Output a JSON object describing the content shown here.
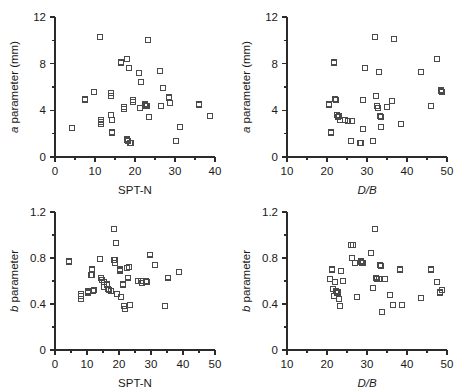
{
  "figure": {
    "background": "#ffffff",
    "marker_color": "#4a4a4a",
    "axis_color": "#2b2b2b",
    "marker_shape": "open-square",
    "marker_size_px": 5
  },
  "chart_data": [
    {
      "id": "a-vs-sptn",
      "type": "scatter",
      "title": "",
      "xlabel": "SPT-N",
      "ylabel": "a parameter (mm)",
      "ylabel_italic_prefix": "a",
      "xlim": [
        0,
        40
      ],
      "ylim": [
        0,
        12
      ],
      "xticks": [
        0,
        10,
        20,
        30,
        40
      ],
      "xticklabels": [
        "0",
        "10",
        "20",
        "30",
        "40"
      ],
      "xminor_step": 5,
      "yticks": [
        0,
        4,
        8,
        12
      ],
      "yticklabels": [
        "0",
        "4",
        "8",
        "12"
      ],
      "yminor_step": 2,
      "grid": false,
      "legend": "none",
      "points": [
        [
          4.2,
          2.5
        ],
        [
          7.5,
          5.0
        ],
        [
          7.6,
          4.9
        ],
        [
          9.7,
          5.6
        ],
        [
          11.3,
          10.3
        ],
        [
          11.5,
          3.2
        ],
        [
          11.5,
          3.0
        ],
        [
          11.6,
          2.8
        ],
        [
          13.9,
          5.5
        ],
        [
          14.0,
          5.2
        ],
        [
          14.1,
          3.6
        ],
        [
          14.2,
          3.2
        ],
        [
          14.3,
          2.1
        ],
        [
          16.5,
          8.1
        ],
        [
          17.2,
          4.3
        ],
        [
          17.3,
          4.1
        ],
        [
          17.9,
          8.4
        ],
        [
          18.1,
          1.5
        ],
        [
          18.3,
          1.4
        ],
        [
          18.6,
          7.6
        ],
        [
          18.8,
          1.2
        ],
        [
          19.0,
          1.2
        ],
        [
          19.5,
          4.9
        ],
        [
          19.6,
          4.7
        ],
        [
          20.9,
          7.2
        ],
        [
          21.2,
          4.2
        ],
        [
          21.5,
          6.4
        ],
        [
          22.6,
          4.5
        ],
        [
          22.8,
          4.4
        ],
        [
          23.0,
          4.4
        ],
        [
          23.2,
          10.0
        ],
        [
          23.4,
          3.4
        ],
        [
          26.3,
          7.4
        ],
        [
          26.6,
          4.4
        ],
        [
          26.9,
          5.9
        ],
        [
          28.5,
          5.1
        ],
        [
          28.8,
          4.6
        ],
        [
          30.3,
          1.4
        ],
        [
          31.2,
          2.6
        ],
        [
          35.9,
          4.5
        ],
        [
          38.8,
          3.5
        ]
      ]
    },
    {
      "id": "a-vs-db",
      "type": "scatter",
      "title": "",
      "xlabel": "D/B",
      "xlabel_italic": true,
      "ylabel": "a parameter (mm)",
      "ylabel_italic_prefix": "a",
      "xlim": [
        10,
        50
      ],
      "ylim": [
        0,
        12
      ],
      "xticks": [
        10,
        20,
        30,
        40,
        50
      ],
      "xticklabels": [
        "10",
        "20",
        "30",
        "40",
        "50"
      ],
      "xminor_step": 5,
      "yticks": [
        0,
        4,
        8,
        12
      ],
      "yticklabels": [
        "0",
        "4",
        "8",
        "12"
      ],
      "yminor_step": 2,
      "grid": false,
      "legend": "none",
      "points": [
        [
          20.6,
          4.5
        ],
        [
          21.0,
          2.1
        ],
        [
          21.8,
          8.1
        ],
        [
          22.1,
          5.0
        ],
        [
          22.3,
          4.9
        ],
        [
          22.5,
          3.6
        ],
        [
          22.7,
          3.4
        ],
        [
          23.0,
          3.5
        ],
        [
          23.2,
          3.2
        ],
        [
          24.6,
          3.2
        ],
        [
          25.2,
          3.1
        ],
        [
          26.0,
          1.4
        ],
        [
          26.3,
          3.1
        ],
        [
          28.3,
          1.2
        ],
        [
          28.6,
          1.2
        ],
        [
          28.9,
          4.9
        ],
        [
          29.1,
          2.4
        ],
        [
          29.6,
          7.6
        ],
        [
          31.6,
          1.4
        ],
        [
          32.0,
          10.3
        ],
        [
          32.2,
          5.2
        ],
        [
          32.5,
          4.4
        ],
        [
          32.8,
          4.2
        ],
        [
          33.0,
          7.3
        ],
        [
          33.2,
          3.5
        ],
        [
          33.4,
          3.4
        ],
        [
          33.6,
          2.6
        ],
        [
          35.1,
          4.3
        ],
        [
          36.2,
          4.8
        ],
        [
          36.8,
          10.1
        ],
        [
          38.6,
          2.8
        ],
        [
          43.6,
          7.3
        ],
        [
          45.9,
          4.4
        ],
        [
          47.5,
          8.4
        ],
        [
          48.4,
          5.7
        ],
        [
          48.8,
          5.6
        ]
      ]
    },
    {
      "id": "b-vs-sptn",
      "type": "scatter",
      "title": "",
      "xlabel": "SPT-N",
      "ylabel": "b parameter",
      "ylabel_italic_prefix": "b",
      "xlim": [
        0,
        50
      ],
      "ylim": [
        0,
        1.2
      ],
      "xticks": [
        0,
        10,
        20,
        30,
        40,
        50
      ],
      "xticklabels": [
        "0",
        "10",
        "20",
        "30",
        "40",
        "50"
      ],
      "xminor_step": 5,
      "yticks": [
        0,
        0.4,
        0.8,
        1.2
      ],
      "yticklabels": [
        "0",
        "0.4",
        "0.8",
        "1.2"
      ],
      "yminor_step": 0.2,
      "grid": false,
      "legend": "none",
      "points": [
        [
          4.3,
          0.77
        ],
        [
          8.0,
          0.49
        ],
        [
          8.1,
          0.47
        ],
        [
          8.2,
          0.44
        ],
        [
          10.2,
          0.51
        ],
        [
          10.4,
          0.5
        ],
        [
          11.4,
          0.65
        ],
        [
          11.6,
          0.7
        ],
        [
          11.8,
          0.51
        ],
        [
          12.2,
          0.52
        ],
        [
          14.2,
          0.79
        ],
        [
          14.4,
          0.63
        ],
        [
          14.6,
          0.61
        ],
        [
          15.2,
          0.59
        ],
        [
          15.4,
          0.55
        ],
        [
          16.3,
          0.57
        ],
        [
          16.5,
          0.53
        ],
        [
          17.0,
          0.52
        ],
        [
          17.4,
          0.51
        ],
        [
          18.3,
          1.05
        ],
        [
          18.6,
          0.78
        ],
        [
          18.8,
          0.76
        ],
        [
          19.0,
          0.93
        ],
        [
          19.2,
          0.93
        ],
        [
          19.4,
          0.49
        ],
        [
          20.2,
          0.7
        ],
        [
          20.4,
          0.69
        ],
        [
          20.6,
          0.46
        ],
        [
          21.2,
          0.57
        ],
        [
          21.6,
          0.38
        ],
        [
          21.8,
          0.36
        ],
        [
          22.6,
          0.71
        ],
        [
          22.8,
          0.63
        ],
        [
          23.2,
          0.72
        ],
        [
          23.5,
          0.39
        ],
        [
          25.8,
          0.6
        ],
        [
          26.8,
          0.6
        ],
        [
          27.2,
          0.58
        ],
        [
          28.3,
          0.6
        ],
        [
          28.6,
          0.59
        ],
        [
          29.8,
          0.83
        ],
        [
          31.2,
          0.74
        ],
        [
          34.5,
          0.38
        ],
        [
          35.4,
          0.63
        ],
        [
          38.8,
          0.68
        ]
      ]
    },
    {
      "id": "b-vs-db",
      "type": "scatter",
      "title": "",
      "xlabel": "D/B",
      "xlabel_italic": true,
      "ylabel": "b parameter",
      "ylabel_italic_prefix": "b",
      "xlim": [
        10,
        50
      ],
      "ylim": [
        0,
        1.2
      ],
      "xticks": [
        10,
        20,
        30,
        40,
        50
      ],
      "xticklabels": [
        "10",
        "20",
        "30",
        "40",
        "50"
      ],
      "xminor_step": 5,
      "yticks": [
        0,
        0.4,
        0.8,
        1.2
      ],
      "yticklabels": [
        "0",
        "0.4",
        "0.8",
        "1.2"
      ],
      "yminor_step": 0.2,
      "grid": false,
      "legend": "none",
      "points": [
        [
          20.8,
          0.62
        ],
        [
          21.2,
          0.7
        ],
        [
          21.5,
          0.53
        ],
        [
          21.8,
          0.47
        ],
        [
          22.0,
          0.59
        ],
        [
          22.3,
          0.51
        ],
        [
          22.6,
          0.5
        ],
        [
          22.8,
          0.5
        ],
        [
          23.0,
          0.44
        ],
        [
          23.3,
          0.38
        ],
        [
          23.6,
          0.69
        ],
        [
          24.0,
          0.6
        ],
        [
          25.9,
          0.91
        ],
        [
          26.2,
          0.8
        ],
        [
          26.5,
          0.91
        ],
        [
          27.0,
          0.76
        ],
        [
          27.6,
          0.46
        ],
        [
          28.4,
          0.77
        ],
        [
          28.7,
          0.76
        ],
        [
          29.0,
          0.76
        ],
        [
          31.0,
          0.84
        ],
        [
          31.5,
          0.54
        ],
        [
          32.0,
          1.05
        ],
        [
          32.3,
          0.63
        ],
        [
          32.6,
          0.62
        ],
        [
          32.9,
          0.62
        ],
        [
          33.2,
          0.74
        ],
        [
          33.5,
          0.73
        ],
        [
          33.8,
          0.33
        ],
        [
          34.5,
          0.62
        ],
        [
          35.8,
          0.48
        ],
        [
          36.5,
          0.39
        ],
        [
          38.3,
          0.7
        ],
        [
          38.8,
          0.39
        ],
        [
          43.5,
          0.45
        ],
        [
          46.0,
          0.7
        ],
        [
          47.6,
          0.59
        ],
        [
          48.2,
          0.5
        ],
        [
          48.8,
          0.52
        ]
      ]
    }
  ]
}
